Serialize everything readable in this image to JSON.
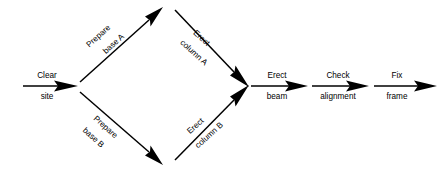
{
  "diagram": {
    "type": "activity-on-arrow-network",
    "background_color": "#ffffff",
    "line_color": "#000000",
    "text_color": "#000000",
    "nodes": [
      {
        "id": "start",
        "name": "start-node",
        "x": 23,
        "y": 86
      },
      {
        "id": "n1",
        "name": "site-cleared-node",
        "x": 76,
        "y": 86
      },
      {
        "id": "n2",
        "name": "bases-top-node",
        "x": 162,
        "y": 8
      },
      {
        "id": "n3",
        "name": "bases-bottom-node",
        "x": 162,
        "y": 164
      },
      {
        "id": "n4",
        "name": "columns-erected-node",
        "x": 248,
        "y": 86
      },
      {
        "id": "n5",
        "name": "beam-erected-node",
        "x": 306,
        "y": 86
      },
      {
        "id": "n6",
        "name": "alignment-node",
        "x": 367,
        "y": 86
      },
      {
        "id": "end",
        "name": "frame-fixed-node",
        "x": 437,
        "y": 86
      }
    ],
    "edges": [
      {
        "id": "clear-site",
        "name": "activity-clear-site",
        "label_top": "Clear",
        "label_bottom": "site",
        "from": "start",
        "to": "n1",
        "orientation": "horizontal",
        "angle_deg": 0
      },
      {
        "id": "prepare-base-a",
        "name": "activity-prepare-base-a",
        "label_top": "Prepare",
        "label_bottom": "base A",
        "from": "n1",
        "to": "n2",
        "orientation": "diagonal-up",
        "angle_deg": -42
      },
      {
        "id": "prepare-base-b",
        "name": "activity-prepare-base-b",
        "label_top": "Prepare",
        "label_bottom": "base B",
        "from": "n1",
        "to": "n3",
        "orientation": "diagonal-down",
        "angle_deg": 42
      },
      {
        "id": "erect-column-a",
        "name": "activity-erect-column-a",
        "label_top": "Erect",
        "label_bottom": "column A",
        "from": "n2",
        "to": "n4",
        "orientation": "diagonal-down",
        "angle_deg": 42
      },
      {
        "id": "erect-column-b",
        "name": "activity-erect-column-b",
        "label_top": "Erect",
        "label_bottom": "column B",
        "from": "n3",
        "to": "n4",
        "orientation": "diagonal-up",
        "angle_deg": -42
      },
      {
        "id": "erect-beam",
        "name": "activity-erect-beam",
        "label_top": "Erect",
        "label_bottom": "beam",
        "from": "n4",
        "to": "n5",
        "orientation": "horizontal",
        "angle_deg": 0
      },
      {
        "id": "check-alignment",
        "name": "activity-check-alignment",
        "label_top": "Check",
        "label_bottom": "alignment",
        "from": "n5",
        "to": "n6",
        "orientation": "horizontal",
        "angle_deg": 0
      },
      {
        "id": "fix-frame",
        "name": "activity-fix-frame",
        "label_top": "Fix",
        "label_bottom": "frame",
        "from": "n6",
        "to": "end",
        "orientation": "horizontal",
        "angle_deg": 0
      }
    ]
  }
}
